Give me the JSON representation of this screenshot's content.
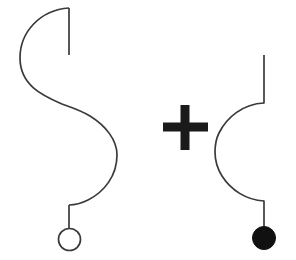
{
  "scene": {
    "title": "Abstract line-art diagram",
    "background_color": "#ffffff",
    "width": 296,
    "height": 260,
    "stroke_color": "#3a3a3a",
    "fill_color": "#111111",
    "plus_color": "#1a1a1a",
    "stroke_width": 1.7
  },
  "elements": {
    "left_figure": {
      "name": "s-curve-figure",
      "description": "S-shaped double arc with straight tail at top and hollow circle pendant at bottom",
      "top_stem": {
        "x": 69,
        "y_start": 8,
        "y_end": 55
      },
      "upper_arc": {
        "bulge_direction": "left",
        "leftmost_x": 20,
        "leftmost_y": 58,
        "start": [
          69,
          8
        ],
        "end": [
          70,
          108
        ]
      },
      "lower_arc": {
        "bulge_direction": "right",
        "rightmost_x": 117,
        "rightmost_y": 155,
        "start": [
          70,
          108
        ],
        "end": [
          69,
          205
        ]
      },
      "bottom_stem": {
        "x": 69,
        "y_start": 205,
        "y_end": 228
      },
      "pendant": {
        "shape": "circle",
        "style": "outline",
        "cx": 69.5,
        "cy": 239.5,
        "r": 11
      }
    },
    "operator": {
      "name": "plus-sign",
      "symbol": "+",
      "center_x": 185,
      "center_y": 127,
      "arm_length": 45,
      "bar_thickness": 9
    },
    "right_figure": {
      "name": "c-curve-figure",
      "description": "C-shaped single arc with straight tail at top and filled circle pendant at bottom",
      "top_stem": {
        "x": 264,
        "y_start": 55,
        "y_end": 103
      },
      "arc": {
        "bulge_direction": "left",
        "leftmost_x": 215,
        "leftmost_y": 152,
        "start": [
          264,
          103
        ],
        "end": [
          264,
          201
        ]
      },
      "bottom_stem": {
        "x": 264,
        "y_start": 201,
        "y_end": 227
      },
      "pendant": {
        "shape": "circle",
        "style": "filled",
        "cx": 264,
        "cy": 238,
        "r": 11.5
      }
    }
  },
  "paths": {
    "s_curve": "M 69 8 C 40 10, 20 32, 20 58 C 20 86, 44 96, 62 104 C 70 107, 80 110, 90 116 C 106 126, 117 140, 117 155 C 117 176, 104 192, 88 200 C 80 204, 74 205, 69 205",
    "c_curve": "M 264 103 C 243 104, 227 117, 219 133 C 215 141, 215 146, 215 152 C 215 160, 217 168, 222 176 C 231 190, 246 200, 264 201"
  },
  "plus_path": "M 180.5 105 L 189.5 105 L 189.5 122.5 L 208 122.5 L 208 131.5 L 189.5 131.5 L 189.5 150 L 180.5 150 L 180.5 131.5 L 163 131.5 L 163 122.5 L 180.5 122.5 Z"
}
